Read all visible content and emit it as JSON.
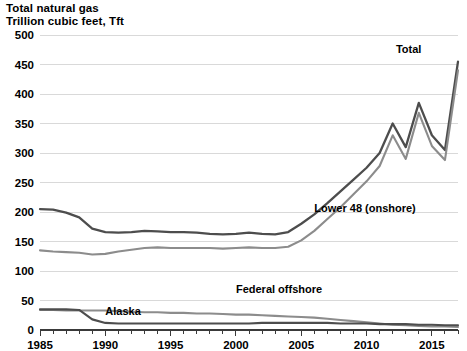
{
  "title": {
    "line1": "Total natural gas",
    "line2": "Trillion cubic feet, Tft"
  },
  "chart_data": {
    "type": "line",
    "title": "Total natural gas",
    "subtitle": "Trillion cubic feet, Tft",
    "xlabel": "",
    "ylabel": "Trillion cubic feet, Tft",
    "xlim": [
      1985,
      2017
    ],
    "ylim": [
      0,
      500
    ],
    "ytick_values": [
      0,
      50,
      100,
      150,
      200,
      250,
      300,
      350,
      400,
      450,
      500
    ],
    "ytick_labels": [
      "0",
      "50",
      "100",
      "150",
      "200",
      "250",
      "300",
      "350",
      "400",
      "450",
      "500"
    ],
    "xtick_values": [
      1985,
      1990,
      1995,
      2000,
      2005,
      2010,
      2015
    ],
    "xtick_labels": [
      "1985",
      "1990",
      "1995",
      "2000",
      "2005",
      "2010",
      "2015"
    ],
    "minor_xticks_every": 1,
    "grid": "horizontal",
    "legend_position": "inline-annotations",
    "x": [
      1985,
      1986,
      1987,
      1988,
      1989,
      1990,
      1991,
      1992,
      1993,
      1994,
      1995,
      1996,
      1997,
      1998,
      1999,
      2000,
      2001,
      2002,
      2003,
      2004,
      2005,
      2006,
      2007,
      2008,
      2009,
      2010,
      2011,
      2012,
      2013,
      2014,
      2015,
      2016,
      2017
    ],
    "series": [
      {
        "name": "Total",
        "color": "#4d4d4d",
        "width": 2.3,
        "label_x": 2014.2,
        "label_y": 470,
        "values": [
          205,
          204,
          199,
          191,
          172,
          166,
          165,
          166,
          168,
          167,
          166,
          166,
          165,
          163,
          162,
          163,
          165,
          163,
          162,
          166,
          180,
          196,
          215,
          235,
          255,
          275,
          300,
          350,
          310,
          385,
          330,
          305,
          455
        ]
      },
      {
        "name": "Lower 48 (onshore)",
        "color": "#8c8c8c",
        "width": 2.1,
        "label_x": 2006.0,
        "label_y": 200,
        "values": [
          135,
          133,
          132,
          131,
          128,
          129,
          133,
          136,
          139,
          140,
          139,
          139,
          139,
          139,
          138,
          139,
          140,
          139,
          139,
          141,
          152,
          168,
          188,
          208,
          230,
          252,
          278,
          330,
          290,
          368,
          312,
          288,
          440
        ]
      },
      {
        "name": "Federal offshore",
        "color": "#8c8c8c",
        "width": 2.1,
        "label_x": 2000.0,
        "label_y": 62,
        "values": [
          34,
          34,
          33,
          33,
          33,
          33,
          32,
          31,
          30,
          30,
          29,
          29,
          28,
          28,
          27,
          26,
          26,
          25,
          24,
          23,
          22,
          21,
          19,
          17,
          15,
          13,
          11,
          9,
          8,
          7,
          6,
          6,
          5
        ]
      },
      {
        "name": "Alaska",
        "color": "#4d4d4d",
        "width": 2.1,
        "label_x": 1990.0,
        "label_y": 26,
        "values": [
          35,
          35,
          35,
          34,
          18,
          12,
          11,
          11,
          11,
          11,
          11,
          11,
          11,
          11,
          11,
          11,
          11,
          12,
          12,
          12,
          12,
          12,
          12,
          11,
          11,
          11,
          10,
          10,
          10,
          9,
          9,
          8,
          8
        ]
      }
    ],
    "annotations": [
      {
        "text": "Total",
        "series": "Total"
      },
      {
        "text": "Lower 48 (onshore)",
        "series": "Lower 48 (onshore)"
      },
      {
        "text": "Federal offshore",
        "series": "Federal offshore"
      },
      {
        "text": "Alaska",
        "series": "Alaska"
      }
    ]
  }
}
